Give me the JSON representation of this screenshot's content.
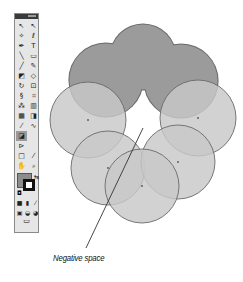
{
  "toolbar": {
    "title": "",
    "tools": [
      {
        "name": "selection-tool",
        "glyph": "↖"
      },
      {
        "name": "direct-selection-tool",
        "glyph": "↖"
      },
      {
        "name": "magic-wand-tool",
        "glyph": "✧"
      },
      {
        "name": "lasso-tool",
        "glyph": "ℓ"
      },
      {
        "name": "pen-tool",
        "glyph": "✒"
      },
      {
        "name": "type-tool",
        "glyph": "T"
      },
      {
        "name": "line-tool",
        "glyph": "╲"
      },
      {
        "name": "rectangle-tool",
        "glyph": "▭"
      },
      {
        "name": "paintbrush-tool",
        "glyph": "╱"
      },
      {
        "name": "pencil-tool",
        "glyph": "✎"
      },
      {
        "name": "blob-brush-tool",
        "glyph": "◩"
      },
      {
        "name": "eraser-tool",
        "glyph": "◇"
      },
      {
        "name": "rotate-tool",
        "glyph": "↻"
      },
      {
        "name": "scale-tool",
        "glyph": "⊡"
      },
      {
        "name": "warp-tool",
        "glyph": "§"
      },
      {
        "name": "free-transform-tool",
        "glyph": "⌗"
      },
      {
        "name": "symbol-sprayer-tool",
        "glyph": "⁂"
      },
      {
        "name": "column-graph-tool",
        "glyph": "▥"
      },
      {
        "name": "mesh-tool",
        "glyph": "▦"
      },
      {
        "name": "gradient-tool",
        "glyph": "◨"
      },
      {
        "name": "eyedropper-tool",
        "glyph": "⁄"
      },
      {
        "name": "blend-tool",
        "glyph": "∿"
      },
      {
        "name": "live-paint-bucket-tool",
        "glyph": "◪",
        "active": true
      },
      {
        "name": "empty-slot",
        "glyph": ""
      },
      {
        "name": "live-paint-selection-tool",
        "glyph": "⊳"
      },
      {
        "name": "empty-slot-2",
        "glyph": ""
      },
      {
        "name": "artboard-tool",
        "glyph": "□"
      },
      {
        "name": "slice-tool",
        "glyph": "⁄"
      },
      {
        "name": "hand-tool",
        "glyph": "✋"
      },
      {
        "name": "zoom-tool",
        "glyph": "⌕"
      }
    ],
    "colors": {
      "fill": "#8c8c8c",
      "stroke": "#111111",
      "swap_glyph": "⇆",
      "reset_glyph": "◘"
    },
    "mode_buttons": [
      {
        "name": "color-mode",
        "glyph": "■"
      },
      {
        "name": "gradient-mode",
        "glyph": "▮"
      },
      {
        "name": "none-mode",
        "glyph": "⁄"
      }
    ],
    "view_buttons": [
      {
        "name": "draw-normal",
        "glyph": "▣"
      },
      {
        "name": "draw-behind",
        "glyph": "◒"
      },
      {
        "name": "draw-inside",
        "glyph": "◕"
      }
    ],
    "screen_mode_glyph": "▭"
  },
  "artwork": {
    "dark_fill": "#9b9b9b",
    "light_fill": "#c8c8c8",
    "stroke_color": "#6a6a6a",
    "dark_union": [
      {
        "cx": 106,
        "cy": 80,
        "r": 37
      },
      {
        "cx": 143,
        "cy": 57,
        "r": 33
      },
      {
        "cx": 181,
        "cy": 81,
        "r": 37
      }
    ],
    "light_circles": [
      {
        "cx": 88,
        "cy": 120,
        "r": 38
      },
      {
        "cx": 198,
        "cy": 118,
        "r": 38
      },
      {
        "cx": 108,
        "cy": 168,
        "r": 37
      },
      {
        "cx": 178,
        "cy": 162,
        "r": 37
      },
      {
        "cx": 142,
        "cy": 186,
        "r": 37
      }
    ],
    "pointer_line": {
      "x1": 143,
      "y1": 128,
      "x2": 86,
      "y2": 248
    }
  },
  "annotation": {
    "label": "Negative space"
  }
}
